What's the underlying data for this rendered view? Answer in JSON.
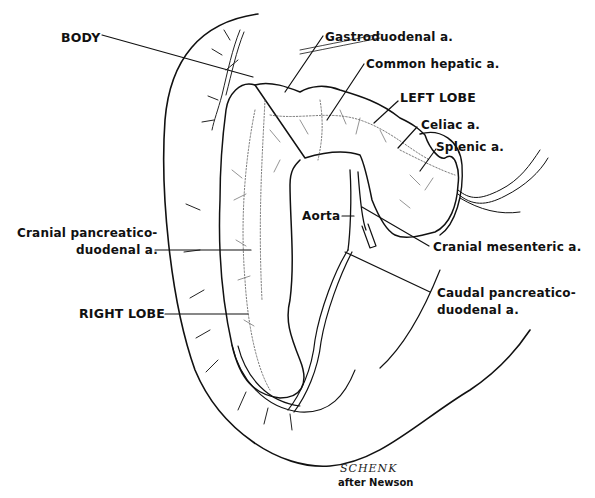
{
  "figure": {
    "labels": {
      "body": "BODY",
      "gastroduodenal": "Gastroduodenal a.",
      "common_hepatic": "Common hepatic a.",
      "left_lobe": "LEFT LOBE",
      "celiac": "Celiac a.",
      "splenic": "Splenic a.",
      "aorta": "Aorta",
      "cranial_mesenteric": "Cranial mesenteric a.",
      "cranial_pd_line1": "Cranial pancreatico-",
      "cranial_pd_line2": "duodenal a.",
      "caudal_pd_line1": "Caudal pancreatico-",
      "caudal_pd_line2": "duodenal a.",
      "right_lobe": "RIGHT LOBE"
    },
    "signature": "SCHENK",
    "credit": "after Newson",
    "colors": {
      "ink": "#111111",
      "background": "#ffffff"
    }
  }
}
